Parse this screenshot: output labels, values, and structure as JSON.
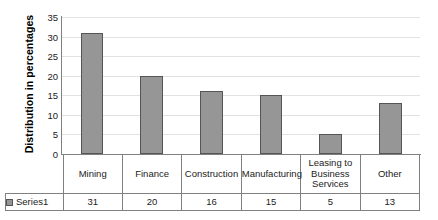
{
  "chart_data": {
    "type": "bar",
    "title": "",
    "xlabel": "",
    "ylabel": "Distribution in percentages",
    "ylim": [
      0,
      35
    ],
    "ytick_step": 5,
    "yticks": [
      "35",
      "30",
      "25",
      "20",
      "15",
      "10",
      "5",
      "0"
    ],
    "grid": true,
    "legend_position": "table-row",
    "categories": [
      "Mining",
      "Finance",
      "Construction",
      "Manufacturing",
      "Leasing to Business Services",
      "Other"
    ],
    "category_lines": [
      [
        "Mining"
      ],
      [
        "Finance"
      ],
      [
        "Construction"
      ],
      [
        "Manufacturing"
      ],
      [
        "Leasing to",
        "Business",
        "Services"
      ],
      [
        "Other"
      ]
    ],
    "series": [
      {
        "name": "Series1",
        "values": [
          31,
          20,
          16,
          15,
          5,
          13
        ]
      }
    ],
    "value_labels": [
      "31",
      "20",
      "16",
      "15",
      "5",
      "13"
    ],
    "colors": {
      "bar_fill": "#969696",
      "bar_outline": "#555555",
      "gridline": "#e2e2e2",
      "axis": "#808080",
      "text": "#222222",
      "background": "#ffffff"
    }
  },
  "legend": {
    "series_label": "Series1",
    "swatch_icon": "square-swatch-icon"
  }
}
